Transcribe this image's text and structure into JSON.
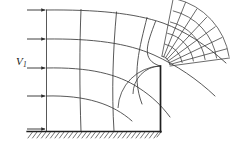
{
  "figure": {
    "type": "flow-net-diagram",
    "background_color": "#ffffff",
    "line_color": "#3a3a3a",
    "boundary_color": "#222222",
    "width": 246,
    "height": 152
  },
  "labels": {
    "inlet_velocity": {
      "text": "V",
      "subscript": "1",
      "x": 17,
      "y": 62,
      "color": "#1a1a1a"
    }
  },
  "inlet_arrows": {
    "count": 5,
    "label": "uniform inlet velocity arrows",
    "x_start": 27,
    "x_end": 46,
    "y_positions": [
      10,
      39,
      68,
      96,
      129
    ]
  },
  "boundaries": {
    "ground": {
      "name": "hatched-ground-boundary",
      "y": 131,
      "x_start": 27,
      "x_end": 161,
      "hatch_count": 30,
      "hatch_length": 7,
      "hatch_angle_deg": 55
    },
    "step_wall": {
      "name": "vertical-step-wall",
      "x": 160,
      "y_top": 66,
      "y_bottom": 132
    },
    "inlet_plane": {
      "name": "inlet-vertical-boundary",
      "x": 46,
      "y_top": 10,
      "y_bottom": 131
    }
  },
  "streamlines": {
    "count": 5,
    "description": "curved streamlines deflecting around the step corner",
    "paths": [
      "M 46,10 C 95,10 135,14 165,24 C 190,33 210,46 227,62",
      "M 46,39 C 92,39 128,44 155,56 C 180,67 200,80 216,95",
      "M 46,68 C 88,68 118,76 140,90 C 152,98 160,106 168,116",
      "M 46,96 C 85,96 112,106 132,122",
      "M 46,131 C 90,131 128,131 160,131"
    ]
  },
  "equipotentials": {
    "count": 8,
    "description": "equipotential lines normal to the streamlines",
    "paths": [
      "M 46,10 L 46,131",
      "M 81,10 C 80,45 80,90 81,131",
      "M 116,12 C 113,50 112,92 114,131",
      "M 147,18 C 140,48 134,80 141,110",
      "M 160,24 C 150,46 144,60 160,66",
      "M 174,28 C 166,46 162,56 164,66",
      "M 189,35 C 182,50 178,58 176,70",
      "M 204,45 C 198,56 194,64 190,76"
    ]
  },
  "radial_mesh": {
    "description": "fine radial/circumferential mesh in the curved outflow region downstream of the corner",
    "center": {
      "x": 160,
      "y": 66
    },
    "inner_radius": 10,
    "outer_radius": 74,
    "ring_count": 6,
    "spoke_count": 10,
    "angle_start_deg": -78,
    "angle_end_deg": -10
  },
  "corner": {
    "name": "step-corner-singularity",
    "x": 160,
    "y": 66,
    "description": "sharp convex corner where streamlines crowd together"
  }
}
